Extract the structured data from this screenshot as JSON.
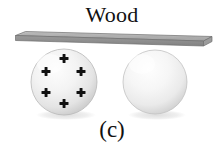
{
  "figure": {
    "title": "Wood",
    "panel_label": "(c)",
    "background_color": "#ffffff",
    "text_color": "#111111"
  },
  "plank": {
    "name": "wood",
    "label": "Wood",
    "top_face_color": "#b4b4b4",
    "front_face_color": "#8e8e8e",
    "end_face_color": "#9c9c9c",
    "outline_color": "#6b6b6b",
    "left_x": 15,
    "right_x": 212,
    "top_y": 31,
    "bottom_y": 46,
    "thickness": 6
  },
  "spheres": [
    {
      "name": "charged-sphere",
      "charge_sign": "+",
      "charge_count": 6,
      "charge_color": "#111111",
      "fill_light": "#fbfbfb",
      "fill_mid": "#eeeeee",
      "fill_dark": "#cfcfcf",
      "edge_color": "#b8b8b8",
      "center_x": 64,
      "center_y": 82,
      "radius": 33,
      "charges": [
        {
          "x": 64,
          "y": 59
        },
        {
          "x": 46,
          "y": 72
        },
        {
          "x": 81,
          "y": 72
        },
        {
          "x": 46,
          "y": 93
        },
        {
          "x": 81,
          "y": 93
        },
        {
          "x": 64,
          "y": 104
        }
      ]
    },
    {
      "name": "neutral-sphere",
      "charge_sign": "",
      "charge_count": 0,
      "charge_color": "#111111",
      "fill_light": "#fdfdfd",
      "fill_mid": "#f2f2f2",
      "fill_dark": "#d6d6d6",
      "edge_color": "#c0c0c0",
      "center_x": 155,
      "center_y": 82,
      "radius": 32,
      "charges": []
    }
  ],
  "shadows": {
    "color": "#e2e2e2",
    "left": {
      "cx": 66,
      "cy": 115,
      "rx": 30,
      "ry": 5
    },
    "right": {
      "cx": 157,
      "cy": 115,
      "rx": 29,
      "ry": 5
    }
  }
}
